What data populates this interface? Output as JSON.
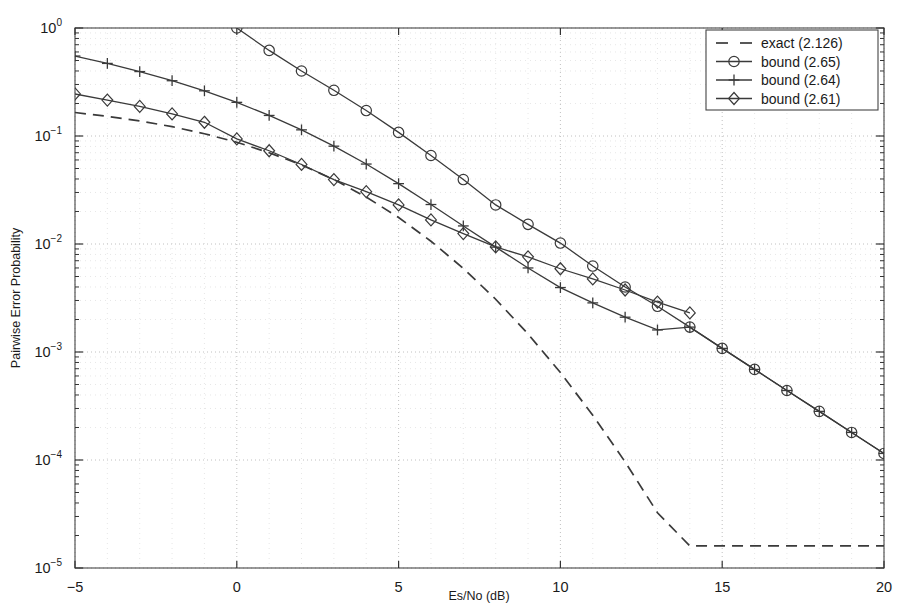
{
  "chart_data": {
    "type": "line",
    "title": "",
    "xlabel": "Es/No (dB)",
    "ylabel": "Pairwise Error Probability",
    "xlim": [
      -5,
      20
    ],
    "ylim": [
      1e-05,
      1
    ],
    "yscale": "log",
    "grid": true,
    "grid_style": "dotted",
    "legend_position": "top-right",
    "xticks": [
      -5,
      0,
      5,
      10,
      15,
      20
    ],
    "xtick_labels": [
      "-5",
      "0",
      "5",
      "10",
      "15",
      "20"
    ],
    "yticks": [
      1,
      0.1,
      0.01,
      0.001,
      0.0001,
      1e-05
    ],
    "ytick_labels": [
      "10^0",
      "10^-1",
      "10^-2",
      "10^-3",
      "10^-4",
      "10^-5"
    ],
    "ytick_mantissas": [
      "10",
      "10",
      "10",
      "10",
      "10",
      "10"
    ],
    "ytick_exponents": [
      "0",
      "-1",
      "-2",
      "-3",
      "-4",
      "-5"
    ],
    "series": [
      {
        "name": "exact (2.126)",
        "style": "dashed",
        "marker": "none",
        "color": "#3a3a3a",
        "x": [
          -5,
          -4,
          -3,
          -2,
          -1,
          0,
          1,
          2,
          3,
          4,
          5,
          6,
          7,
          8,
          9,
          10,
          11,
          12,
          13,
          14,
          15,
          16,
          17,
          18,
          19,
          20
        ],
        "y": [
          0.165,
          0.152,
          0.138,
          0.122,
          0.105,
          0.0875,
          0.07,
          0.054,
          0.0395,
          0.0272,
          0.0176,
          0.0106,
          0.00595,
          0.00308,
          0.00147,
          0.000645,
          0.00026,
          9.6e-05,
          3.25e-05,
          1.6e-05,
          1.6e-05,
          1.6e-05,
          1.6e-05,
          1.6e-05,
          1.6e-05,
          1.6e-05
        ]
      },
      {
        "name": "bound (2.65)",
        "style": "solid",
        "marker": "circle",
        "color": "#3a3a3a",
        "x": [
          0,
          1,
          2,
          3,
          4,
          5,
          6,
          7,
          8,
          9,
          10,
          11,
          12,
          13,
          14,
          15,
          16,
          17,
          18,
          19,
          20
        ],
        "y": [
          1.0,
          0.62,
          0.4,
          0.265,
          0.172,
          0.108,
          0.066,
          0.0395,
          0.023,
          0.0152,
          0.0102,
          0.00625,
          0.004,
          0.00265,
          0.0017,
          0.00108,
          0.00069,
          0.00044,
          0.000282,
          0.00018,
          0.000115
        ]
      },
      {
        "name": "bound (2.64)",
        "style": "solid",
        "marker": "plus",
        "color": "#3a3a3a",
        "x": [
          -5,
          -4,
          -3,
          -2,
          -1,
          0,
          1,
          2,
          3,
          4,
          5,
          6,
          7,
          8,
          9,
          10,
          11,
          12,
          13,
          14,
          15,
          16,
          17,
          18,
          19,
          20
        ],
        "y": [
          0.55,
          0.47,
          0.395,
          0.325,
          0.262,
          0.205,
          0.155,
          0.114,
          0.0805,
          0.055,
          0.0362,
          0.0232,
          0.0147,
          0.00935,
          0.006,
          0.00395,
          0.00285,
          0.0021,
          0.0016,
          0.0017,
          0.00108,
          0.00069,
          0.00044,
          0.000282,
          0.00018,
          0.000115
        ]
      },
      {
        "name": "bound (2.61)",
        "style": "solid",
        "marker": "diamond",
        "color": "#3a3a3a",
        "x": [
          -5,
          -4,
          -3,
          -2,
          -1,
          0,
          1,
          2,
          3,
          4,
          5,
          6,
          7,
          8,
          9,
          10,
          11,
          12,
          13,
          14
        ],
        "y": [
          0.245,
          0.215,
          0.188,
          0.16,
          0.134,
          0.094,
          0.073,
          0.0545,
          0.0395,
          0.0305,
          0.023,
          0.0167,
          0.0125,
          0.0094,
          0.0076,
          0.0059,
          0.00475,
          0.00375,
          0.0029,
          0.0023
        ]
      }
    ]
  },
  "legend": {
    "entries": [
      {
        "label": "exact (2.126)",
        "marker": "dashed-line"
      },
      {
        "label": "bound (2.65)",
        "marker": "circle"
      },
      {
        "label": "bound (2.64)",
        "marker": "plus"
      },
      {
        "label": "bound (2.61)",
        "marker": "diamond"
      }
    ]
  }
}
